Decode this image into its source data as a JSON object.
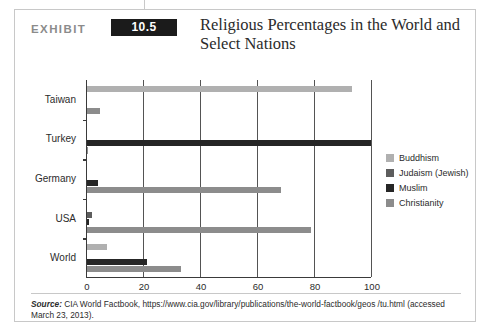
{
  "exhibit": {
    "label": "EXHIBIT",
    "number": "10.5",
    "title": "Religious Percentages in the World and Select Nations"
  },
  "source": {
    "label": "Source:",
    "text": " CIA World Factbook, https://www.cia.gov/library/publications/the-world-factbook/geos /tu.html (accessed March 23, 2013)."
  },
  "colors": {
    "buddhism": "#b0b0b0",
    "judaism": "#5d5d5d",
    "muslim": "#262626",
    "christianity": "#8c8c8c",
    "axis": "#3a3a3a",
    "gridline": "#545454",
    "frame_border": "#c8c8c8",
    "exhibit_box": "#1b1b1b"
  },
  "chart_data": {
    "type": "bar",
    "orientation": "horizontal",
    "title": "Religious Percentages in the World and Select Nations",
    "xlabel": "",
    "ylabel": "",
    "xlim": [
      0,
      100
    ],
    "xticks": [
      0,
      20,
      40,
      60,
      80,
      100
    ],
    "grid": true,
    "legend_position": "right",
    "categories": [
      "World",
      "USA",
      "Germany",
      "Turkey",
      "Taiwan"
    ],
    "series": [
      {
        "name": "Buddhism",
        "color": "#b0b0b0",
        "values": [
          7.1,
          0.0,
          0.0,
          0.0,
          93.0
        ]
      },
      {
        "name": "Judaism (Jewish)",
        "color": "#5d5d5d",
        "values": [
          0.0,
          1.7,
          0.0,
          0.0,
          0.0
        ]
      },
      {
        "name": "Muslim",
        "color": "#262626",
        "values": [
          21.0,
          0.6,
          3.7,
          99.8,
          0.0
        ]
      },
      {
        "name": "Christianity",
        "color": "#8c8c8c",
        "values": [
          33.0,
          78.5,
          68.0,
          0.2,
          4.5
        ]
      }
    ]
  }
}
